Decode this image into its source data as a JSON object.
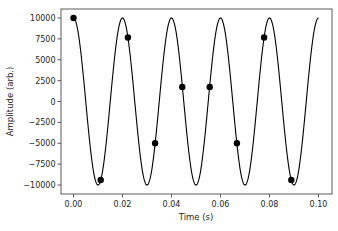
{
  "chart_data": {
    "type": "line",
    "title": "",
    "xlabel": "Time (s)",
    "ylabel": "Amplitude (arb.)",
    "xlim": [
      -0.005,
      0.105
    ],
    "ylim": [
      -11000,
      11000
    ],
    "grid": false,
    "legend": null,
    "x_ticks": [
      0.0,
      0.02,
      0.04,
      0.06,
      0.08,
      0.1
    ],
    "x_tick_labels": [
      "0.00",
      "0.02",
      "0.04",
      "0.06",
      "0.08",
      "0.10"
    ],
    "y_ticks": [
      10000,
      7500,
      5000,
      2500,
      0,
      -2500,
      -5000,
      -7500,
      -10000
    ],
    "y_tick_labels": [
      "10000",
      "7500",
      "5000",
      "2500",
      "0",
      "−2500",
      "−5000",
      "−7500",
      "−10000"
    ],
    "series": [
      {
        "name": "continuous signal",
        "style": "line",
        "color": "#000000",
        "function": "10000*cos(2*pi*50*t)",
        "t_range": [
          0,
          0.1
        ],
        "frequency_hz": 50,
        "amplitude": 10000
      },
      {
        "name": "samples",
        "style": "markers",
        "color": "#000000",
        "x": [
          0.0,
          0.0111,
          0.0222,
          0.0333,
          0.0444,
          0.0556,
          0.0667,
          0.0778,
          0.0889
        ],
        "y": [
          10000,
          -9397,
          7660,
          -5000,
          1736,
          1736,
          -5000,
          7660,
          -9397
        ]
      }
    ]
  }
}
